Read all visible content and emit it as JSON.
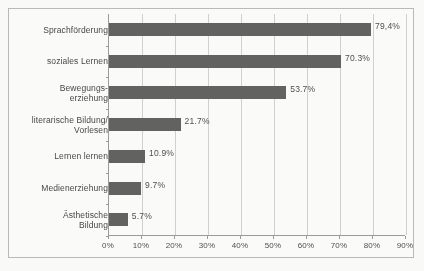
{
  "chart_data": {
    "type": "bar",
    "orientation": "horizontal",
    "title": "",
    "subtitle": "",
    "xlabel": "",
    "ylabel": "",
    "categories": [
      "Sprachförderung",
      "soziales Lernen",
      "Bewegungs-\nerziehung",
      "literarische Bildung/\nVorlesen",
      "Lernen lernen",
      "Medienerziehung",
      "Ästhetische\nBildung"
    ],
    "values": [
      79.4,
      70.3,
      53.7,
      21.7,
      10.9,
      9.7,
      5.7
    ],
    "value_labels": [
      "79,4%",
      "70.3%",
      "53.7%",
      "21.7%",
      "10.9%",
      "9.7%",
      "5.7%"
    ],
    "xlim": [
      0,
      90
    ],
    "xticks": [
      0,
      10,
      20,
      30,
      40,
      50,
      60,
      70,
      80,
      90
    ],
    "xticklabels": [
      "0%",
      "10%",
      "20%",
      "30%",
      "40%",
      "50%",
      "60%",
      "70%",
      "80%",
      "90%"
    ],
    "grid": true,
    "grid_axis": "x",
    "legend": false,
    "bar_color": "#5e5e5c",
    "plot_background": "#fefefd",
    "gridline_color": "#d2d2cf",
    "axis_color": "#9a9a97"
  }
}
